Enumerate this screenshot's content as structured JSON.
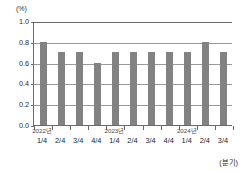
{
  "chart_data": {
    "type": "bar",
    "title": "",
    "xlabel": "(분기)",
    "ylabel": "(%)",
    "ylim": [
      0.0,
      1.0
    ],
    "grid": true,
    "legend": "none",
    "categories": [
      "1/4",
      "2/4",
      "3/4",
      "4/4",
      "1/4",
      "2/4",
      "3/4",
      "4/4",
      "1/4",
      "2/4",
      "3/4"
    ],
    "values": [
      0.8,
      0.7,
      0.7,
      0.6,
      0.7,
      0.7,
      0.7,
      0.7,
      0.7,
      0.8,
      0.7
    ],
    "ytick_labels": [
      "1.0",
      "0.8",
      "0.6",
      "0.4",
      "0.2",
      "0.0"
    ],
    "ytick_values": [
      1.0,
      0.8,
      0.6,
      0.4,
      0.2,
      0.0
    ],
    "group_labels": [
      {
        "text": "2022년",
        "at_index": 0
      },
      {
        "text": "2023년",
        "at_index": 4
      },
      {
        "text": "2024년",
        "at_index": 8
      }
    ],
    "bar_color": "#828282",
    "axis_color": "#6a6a6a",
    "grid_color": "#9a9a9a"
  }
}
